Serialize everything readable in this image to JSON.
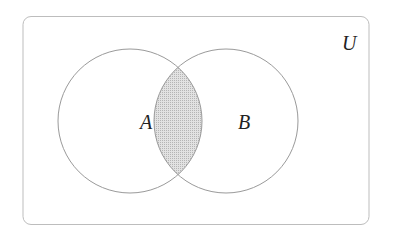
{
  "diagram": {
    "type": "venn",
    "universe_label": "U",
    "sets": [
      {
        "label": "A"
      },
      {
        "label": "B"
      }
    ],
    "shaded_region": "A ∩ B",
    "colors": {
      "outline": "#9a9a9a",
      "shade": "#cfcfcf",
      "text": "#222222"
    }
  }
}
